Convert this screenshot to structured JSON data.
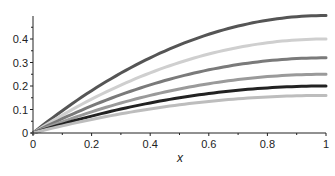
{
  "chart_data": {
    "type": "line",
    "title": "",
    "xlabel": "x",
    "ylabel": "",
    "xlim": [
      0,
      1
    ],
    "ylim": [
      0,
      0.5
    ],
    "grid": false,
    "legend": "none",
    "x_ticks": [
      "0",
      "0.2",
      "0.4",
      "0.6",
      "0.8",
      "1"
    ],
    "y_ticks": [
      "0",
      "0.1",
      "0.2",
      "0.3",
      "0.4"
    ],
    "x": [
      0,
      0.1,
      0.2,
      0.3,
      0.4,
      0.5,
      0.6,
      0.7,
      0.8,
      0.9,
      1.0
    ],
    "series": [
      {
        "name": "curve-1",
        "color": "#555555",
        "values": [
          0,
          0.095,
          0.18,
          0.255,
          0.32,
          0.375,
          0.42,
          0.455,
          0.48,
          0.495,
          0.5
        ]
      },
      {
        "name": "curve-2",
        "color": "#cfcfcf",
        "values": [
          0,
          0.076,
          0.144,
          0.204,
          0.256,
          0.3,
          0.336,
          0.364,
          0.384,
          0.396,
          0.4
        ]
      },
      {
        "name": "curve-3",
        "color": "#7a7a7a",
        "values": [
          0,
          0.061,
          0.115,
          0.163,
          0.205,
          0.24,
          0.269,
          0.291,
          0.307,
          0.317,
          0.32
        ]
      },
      {
        "name": "curve-4",
        "color": "#9a9a9a",
        "values": [
          0,
          0.048,
          0.09,
          0.128,
          0.16,
          0.188,
          0.21,
          0.228,
          0.24,
          0.248,
          0.25
        ]
      },
      {
        "name": "curve-5",
        "color": "#222222",
        "values": [
          0,
          0.038,
          0.072,
          0.102,
          0.128,
          0.15,
          0.168,
          0.182,
          0.192,
          0.198,
          0.2
        ]
      },
      {
        "name": "curve-6",
        "color": "#bdbdbd",
        "values": [
          0,
          0.03,
          0.058,
          0.082,
          0.102,
          0.12,
          0.134,
          0.146,
          0.154,
          0.158,
          0.16
        ]
      }
    ]
  }
}
